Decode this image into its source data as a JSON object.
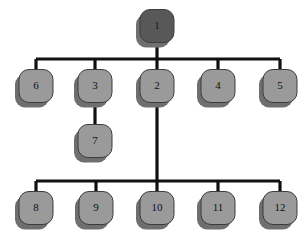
{
  "diagram": {
    "type": "hierarchy-tree",
    "canvas": {
      "width": 306,
      "height": 250,
      "background": "#ffffff"
    },
    "style": {
      "root_fill": "#585858",
      "node_fill": "#9a9a9a",
      "node_stroke": "#3c3c3c",
      "shadow_fill": "#6f6f6f",
      "connector_color": "#111111",
      "connector_width": 3.2,
      "node_width": 34,
      "node_height": 33,
      "corner_radius": 10,
      "shadow_dx": -4,
      "shadow_dy": 5,
      "label_color": "#111111"
    },
    "nodes": [
      {
        "id": "n1",
        "label": "1",
        "x": 157,
        "y": 26,
        "variant": "root"
      },
      {
        "id": "n6",
        "label": "6",
        "x": 36,
        "y": 86,
        "variant": "normal"
      },
      {
        "id": "n3",
        "label": "3",
        "x": 95,
        "y": 86,
        "variant": "normal"
      },
      {
        "id": "n2",
        "label": "2",
        "x": 157,
        "y": 86,
        "variant": "normal"
      },
      {
        "id": "n4",
        "label": "4",
        "x": 218,
        "y": 86,
        "variant": "normal"
      },
      {
        "id": "n5",
        "label": "5",
        "x": 280,
        "y": 86,
        "variant": "normal"
      },
      {
        "id": "n7",
        "label": "7",
        "x": 95,
        "y": 141,
        "variant": "normal"
      },
      {
        "id": "n8",
        "label": "8",
        "x": 36,
        "y": 208,
        "variant": "normal"
      },
      {
        "id": "n9",
        "label": "9",
        "x": 96,
        "y": 208,
        "variant": "normal"
      },
      {
        "id": "n10",
        "label": "10",
        "x": 157,
        "y": 208,
        "variant": "normal"
      },
      {
        "id": "n11",
        "label": "11",
        "x": 218,
        "y": 208,
        "variant": "normal"
      },
      {
        "id": "n12",
        "label": "12",
        "x": 280,
        "y": 208,
        "variant": "normal"
      }
    ],
    "edges": [
      {
        "from": "n1",
        "to": "n6",
        "kind": "bus-top"
      },
      {
        "from": "n1",
        "to": "n3",
        "kind": "bus-top"
      },
      {
        "from": "n1",
        "to": "n2",
        "kind": "trunk"
      },
      {
        "from": "n1",
        "to": "n4",
        "kind": "bus-top"
      },
      {
        "from": "n1",
        "to": "n5",
        "kind": "bus-top"
      },
      {
        "from": "n3",
        "to": "n7",
        "kind": "direct"
      },
      {
        "from": "n2",
        "to": "n8",
        "kind": "bus-bottom"
      },
      {
        "from": "n2",
        "to": "n9",
        "kind": "bus-bottom"
      },
      {
        "from": "n2",
        "to": "n10",
        "kind": "trunk"
      },
      {
        "from": "n2",
        "to": "n11",
        "kind": "bus-bottom"
      },
      {
        "from": "n2",
        "to": "n12",
        "kind": "bus-bottom"
      }
    ],
    "buses": [
      {
        "id": "bus-top",
        "y": 59,
        "x_start": 36,
        "x_end": 280
      },
      {
        "id": "bus-bottom",
        "y": 181,
        "x_start": 36,
        "x_end": 280
      }
    ]
  }
}
